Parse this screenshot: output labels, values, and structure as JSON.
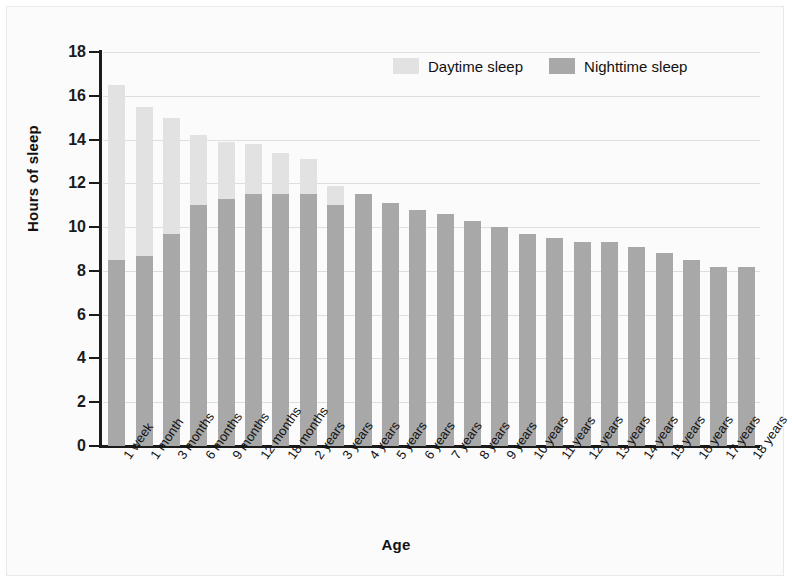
{
  "chart_data": {
    "type": "bar",
    "subtype": "stacked",
    "title": "",
    "xlabel": "Age",
    "ylabel": "Hours of sleep",
    "ylim": [
      0,
      18
    ],
    "ytick_step": 2,
    "yticks": [
      0,
      2,
      4,
      6,
      8,
      10,
      12,
      14,
      16,
      18
    ],
    "grid": "horizontal",
    "legend_position": "top-right",
    "categories": [
      "1 week",
      "1 month",
      "3 months",
      "6 months",
      "9 months",
      "12 months",
      "18 months",
      "2 years",
      "3 years",
      "4 years",
      "5 years",
      "6 years",
      "7 years",
      "8 years",
      "9 years",
      "10 years",
      "11 years",
      "12 years",
      "13 years",
      "14 years",
      "15 years",
      "16 years",
      "17 years",
      "18 years"
    ],
    "series": [
      {
        "name": "Nighttime sleep",
        "color": "#a8a8a8",
        "values": [
          8.5,
          8.7,
          9.7,
          11.0,
          11.3,
          11.5,
          11.5,
          11.5,
          11.0,
          11.5,
          11.1,
          10.8,
          10.6,
          10.3,
          10.0,
          9.7,
          9.5,
          9.3,
          9.3,
          9.1,
          8.8,
          8.5,
          8.2,
          8.2
        ]
      },
      {
        "name": "Daytime sleep",
        "color": "#e2e2e2",
        "values": [
          8.0,
          6.8,
          5.3,
          3.2,
          2.6,
          2.3,
          1.9,
          1.6,
          0.9,
          0,
          0,
          0,
          0,
          0,
          0,
          0,
          0,
          0,
          0,
          0,
          0,
          0,
          0,
          0
        ]
      }
    ],
    "totals": [
      16.5,
      15.5,
      15.0,
      14.2,
      13.9,
      13.8,
      13.4,
      13.1,
      11.9,
      11.5,
      11.1,
      10.8,
      10.6,
      10.3,
      10.0,
      9.7,
      9.5,
      9.3,
      9.3,
      9.1,
      8.8,
      8.5,
      8.2,
      8.2
    ]
  },
  "legend": {
    "entries": [
      {
        "label": "Daytime sleep",
        "color": "#e2e2e2",
        "name": "daytime-sleep"
      },
      {
        "label": "Nighttime sleep",
        "color": "#a8a8a8",
        "name": "nighttime-sleep"
      }
    ]
  },
  "axes": {
    "y_title": "Hours of sleep",
    "x_title": "Age"
  },
  "colors": {
    "daytime": "#e2e2e2",
    "nighttime": "#a8a8a8",
    "axis": "#1b1b1b",
    "grid": "#dedede",
    "background": "#fbfbfb"
  }
}
